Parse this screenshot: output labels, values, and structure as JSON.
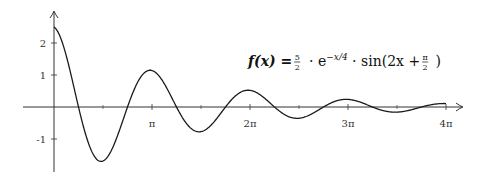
{
  "chart_data": {
    "type": "line",
    "title": "",
    "function": "f(x) = 5/2 · e^(-x/4) · sin(2x + π/2)",
    "annotation": {
      "prefix": "f(x) = ",
      "frac_num": "5",
      "frac_den": "2",
      "exp_base": " · e",
      "exponent": "−x/4",
      "sin_part": " · sin(2x + ",
      "pi_num": "π",
      "pi_den": "2",
      "close": ")"
    },
    "xlabel": "",
    "ylabel": "",
    "xlim": [
      -0.95,
      4.2
    ],
    "xlim_units": "multiples of π",
    "ylim": [
      -2.0,
      2.95
    ],
    "x_domain": [
      0,
      12.566
    ],
    "amplitude": 2.5,
    "decay": 0.25,
    "frequency": 2,
    "phase": 1.5708,
    "x_ticks": [
      {
        "value": 1,
        "label": "π"
      },
      {
        "value": 2,
        "label": "2π"
      },
      {
        "value": 3,
        "label": "3π"
      },
      {
        "value": 4,
        "label": "4π"
      }
    ],
    "x_minor_ticks": [
      0.5,
      1.5,
      2.5,
      3.5
    ],
    "y_ticks": [
      {
        "value": 2,
        "label": "2"
      },
      {
        "value": 1,
        "label": "1"
      },
      {
        "value": -1,
        "label": "-1"
      }
    ],
    "grid": false,
    "legend": "none",
    "colors": {
      "curve": "#1a1a1a",
      "axis": "#333333"
    }
  }
}
